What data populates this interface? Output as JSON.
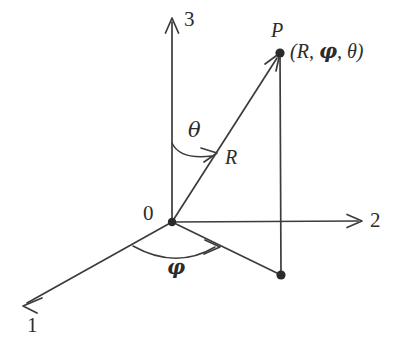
{
  "figure": {
    "kind": "spherical-coordinate-diagram",
    "background_color": "#ffffff",
    "stroke_color": "#3c3c3c",
    "text_color": "#2b2b2b"
  },
  "axes": [
    {
      "id": "axis-1",
      "label": "1",
      "direction": "down-left",
      "origin": [
        172,
        222
      ],
      "tip": [
        23,
        306
      ],
      "label_pos": [
        27,
        315
      ]
    },
    {
      "id": "axis-2",
      "label": "2",
      "direction": "right",
      "origin": [
        172,
        222
      ],
      "tip": [
        362,
        221
      ],
      "label_pos": [
        370,
        210
      ]
    },
    {
      "id": "axis-3",
      "label": "3",
      "direction": "up",
      "origin": [
        172,
        222
      ],
      "tip": [
        172,
        18
      ],
      "label_pos": [
        184,
        9
      ]
    }
  ],
  "origin": {
    "label": "0",
    "label_pos": [
      143,
      203
    ],
    "point": [
      172,
      222
    ]
  },
  "point_p": {
    "label": "P",
    "label_pos": [
      271,
      20
    ],
    "coords_text_prefix": "(R, ",
    "coords_text_phi": "φ",
    "coords_text_suffix": ", θ)",
    "coords_pos": [
      290,
      41
    ],
    "position": [
      280,
      53
    ]
  },
  "projection_point": {
    "name": "xy-plane-projection",
    "position": [
      281,
      275
    ]
  },
  "radius": {
    "label": "R",
    "label_pos": [
      225,
      147
    ],
    "from": [
      172,
      222
    ],
    "to": [
      280,
      53
    ]
  },
  "angles": [
    {
      "id": "theta",
      "label": "θ",
      "label_pos": [
        188,
        120
      ],
      "description": "polar angle from axis 3 to radius R",
      "arc_start": [
        172,
        143
      ],
      "arc_end": [
        216,
        153
      ]
    },
    {
      "id": "phi",
      "label": "φ",
      "label_pos": [
        167,
        257
      ],
      "description": "azimuthal angle from axis 1 to projection in plane",
      "arc_start": [
        133,
        246
      ],
      "arc_end": [
        219,
        248
      ]
    }
  ],
  "drop_line": {
    "name": "vertical-drop-from-p",
    "from": [
      280,
      53
    ],
    "to": [
      281,
      275
    ]
  }
}
